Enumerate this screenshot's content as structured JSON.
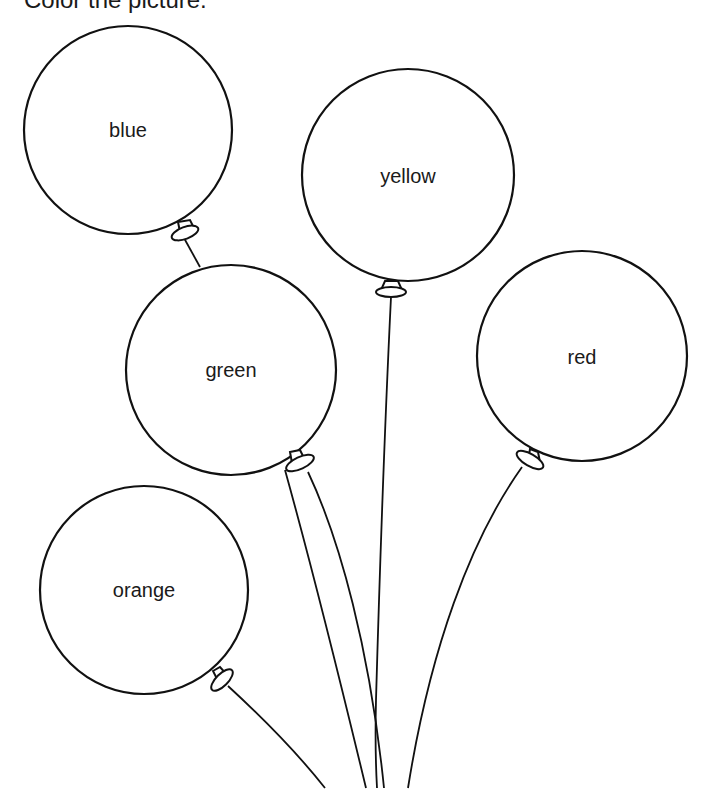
{
  "instruction": "Color the picture.",
  "balloons": [
    {
      "label": "blue",
      "cx": 128,
      "cy": 130,
      "r": 104,
      "label_y": 137
    },
    {
      "label": "yellow",
      "cx": 408,
      "cy": 175,
      "r": 106,
      "label_y": 183
    },
    {
      "label": "green",
      "cx": 231,
      "cy": 370,
      "r": 105,
      "label_y": 377
    },
    {
      "label": "red",
      "cx": 582,
      "cy": 356,
      "r": 105,
      "label_y": 364
    },
    {
      "label": "orange",
      "cx": 144,
      "cy": 590,
      "r": 104,
      "label_y": 597
    }
  ]
}
